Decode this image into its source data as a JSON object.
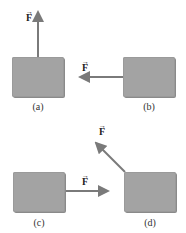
{
  "panels": [
    {
      "id": "a",
      "caption": "(a)",
      "force_label": "F",
      "vector_mark": "→",
      "direction": "up"
    },
    {
      "id": "b",
      "caption": "(b)",
      "force_label": "F",
      "vector_mark": "→",
      "direction": "left"
    },
    {
      "id": "c",
      "caption": "(c)",
      "force_label": "F",
      "vector_mark": "→",
      "direction": "right"
    },
    {
      "id": "d",
      "caption": "(d)",
      "force_label": "F",
      "vector_mark": "→",
      "direction": "up-left"
    }
  ],
  "colors": {
    "block": "#a3a3a3",
    "arrow": "#7a7a7a"
  }
}
